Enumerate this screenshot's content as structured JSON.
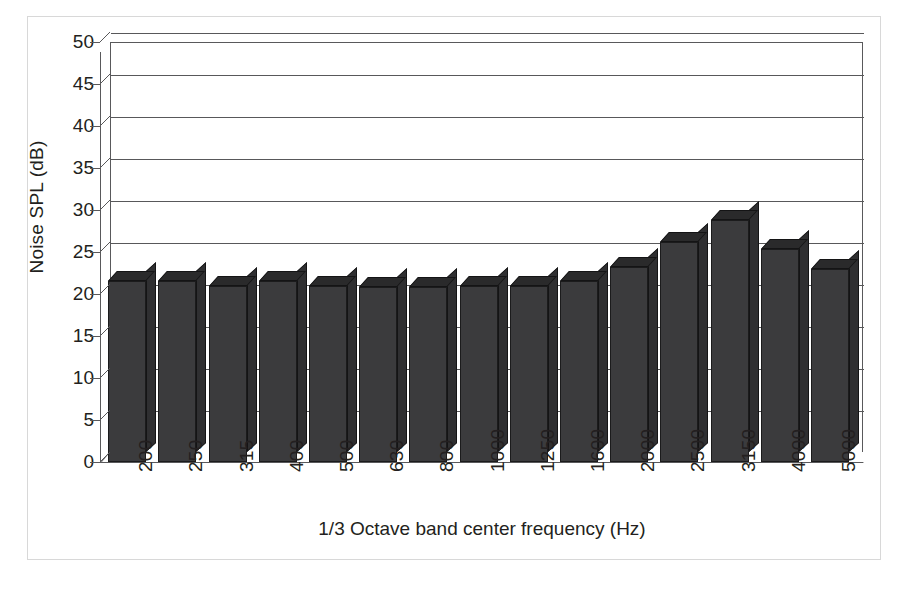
{
  "chart_data": {
    "type": "bar",
    "title": "",
    "xlabel": "1/3 Octave band center frequency (Hz)",
    "ylabel": "Noise SPL (dB)",
    "categories": [
      "200",
      "250",
      "315",
      "400",
      "500",
      "630",
      "800",
      "1000",
      "1250",
      "1600",
      "2000",
      "2500",
      "3150",
      "4000",
      "5000"
    ],
    "values": [
      21.5,
      21.5,
      21.0,
      21.5,
      21.0,
      20.8,
      20.8,
      21.0,
      21.0,
      21.5,
      23.2,
      26.2,
      28.8,
      25.3,
      23.0
    ],
    "series": [
      {
        "name": "Noise SPL",
        "values": [
          21.5,
          21.5,
          21.0,
          21.5,
          21.0,
          20.8,
          20.8,
          21.0,
          21.0,
          21.5,
          23.2,
          26.2,
          28.8,
          25.3,
          23.0
        ]
      }
    ],
    "ylim": [
      0,
      50
    ],
    "ytick_step": 5,
    "yticks": [
      50,
      45,
      40,
      35,
      30,
      25,
      20,
      15,
      10,
      5,
      0
    ],
    "ytick_labels": [
      "50",
      "45",
      "40",
      "35",
      "30",
      "25",
      "20",
      "15",
      "10",
      "5",
      "0"
    ],
    "grid": true,
    "grid_axis": "y",
    "legend": false,
    "legend_position": "none",
    "style": "3d-column",
    "bar_color": "#3b3b3d",
    "bar_top_color": "#2a2a2b",
    "bar_side_color": "#2f2f31",
    "axis_color": "#58585a",
    "text_color": "#231f20",
    "background_color": "#ffffff",
    "frame_color": "#d8d8d8",
    "xtick_rotation": 90
  }
}
